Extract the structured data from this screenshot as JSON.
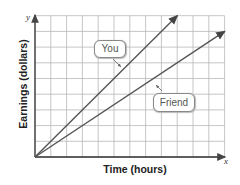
{
  "chart_data": {
    "type": "line",
    "title": "",
    "xlabel": "Time (hours)",
    "ylabel": "Earnings (dollars)",
    "x_axis_name": "x",
    "y_axis_name": "y",
    "grid": true,
    "grid_columns": 12,
    "grid_rows": 9,
    "tick_labels": [],
    "series": [
      {
        "name": "You",
        "points": [
          [
            0,
            0
          ],
          [
            9,
            9
          ]
        ],
        "slope": 1,
        "color": "#555555"
      },
      {
        "name": "Friend",
        "points": [
          [
            0,
            0
          ],
          [
            12,
            8
          ]
        ],
        "slope": 0.6667,
        "color": "#555555"
      }
    ],
    "annotations": [
      {
        "text": "You",
        "points_to": "You"
      },
      {
        "text": "Friend",
        "points_to": "Friend"
      }
    ]
  },
  "colors": {
    "grid": "#b8b8b8",
    "axis": "#333333",
    "line": "#555555"
  }
}
